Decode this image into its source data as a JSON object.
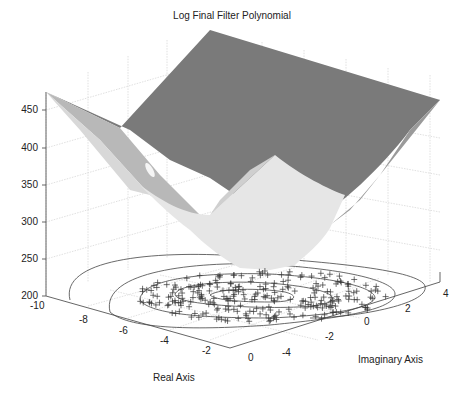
{
  "chart_data": {
    "type": "surface3d",
    "title": "Log Final Filter Polynomial",
    "xlabel": "Real Axis",
    "ylabel": "Imaginary Axis",
    "zlabel": "",
    "x_ticks": [
      "-10",
      "-8",
      "-6",
      "-4",
      "-2",
      "0"
    ],
    "y_ticks": [
      "-4",
      "-2",
      "0",
      "2",
      "4"
    ],
    "z_ticks": [
      "200",
      "250",
      "300",
      "350",
      "400",
      "450"
    ],
    "xlim": [
      -10,
      0
    ],
    "ylim": [
      -4,
      4
    ],
    "zlim": [
      200,
      475
    ],
    "grid": true,
    "surface": {
      "description": "Saddle/bowl shaped log-magnitude surface with minimum near z=250 at center of domain, rising to ~475 at corners",
      "corner_values": {
        "x=-10,y=4": 470,
        "x=-6,y=4": 480,
        "x=0,y=4": 420,
        "x=-10,y=-4": 465,
        "x=0,y=-4": 440
      },
      "min_value": 250
    },
    "contour_floor": {
      "levels": 4,
      "markers": "+ (polynomial roots scattered over domain, approx x in [-8.5, 0], y in [-4, 3.5])",
      "marker_count_approx": 300
    }
  },
  "labels": {
    "title": "Log Final Filter Polynomial",
    "xlabel": "Real Axis",
    "ylabel": "Imaginary Axis",
    "z": [
      "450",
      "400",
      "350",
      "300",
      "250",
      "200"
    ],
    "x": [
      "-10",
      "-8",
      "-6",
      "-4",
      "-2",
      "0"
    ],
    "y": [
      "-4",
      "-2",
      "0",
      "2",
      "4"
    ]
  }
}
